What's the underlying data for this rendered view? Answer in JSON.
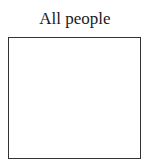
{
  "diagram": {
    "title": "All people",
    "box": {
      "label": "",
      "border_color": "#333333",
      "fill_color": "#ffffff"
    }
  }
}
